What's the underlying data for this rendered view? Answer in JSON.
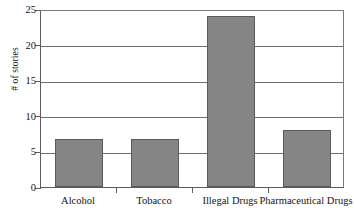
{
  "chart_data": {
    "type": "bar",
    "title": "",
    "subtitle": "",
    "xlabel": "",
    "ylabel": "# of stories",
    "categories": [
      "Alcohol",
      "Tobacco",
      "Illegal Drugs",
      "Pharmaceutical Drugs"
    ],
    "values": [
      6.8,
      6.8,
      24,
      8
    ],
    "ylim": [
      0,
      25
    ],
    "ytick_values": [
      0,
      5,
      10,
      15,
      20,
      25
    ],
    "ytick_labels": [
      "0",
      "5",
      "10",
      "15",
      "20",
      "25"
    ],
    "grid": "horizontal",
    "legend": "none",
    "annotations": [],
    "colors": {
      "bar_fill": "#858585",
      "bar_border": "#5a5a5a",
      "gridline": "#6f6f6f",
      "axis": "#5d5d5d",
      "background": "#ffffff",
      "text": "#141414"
    }
  }
}
